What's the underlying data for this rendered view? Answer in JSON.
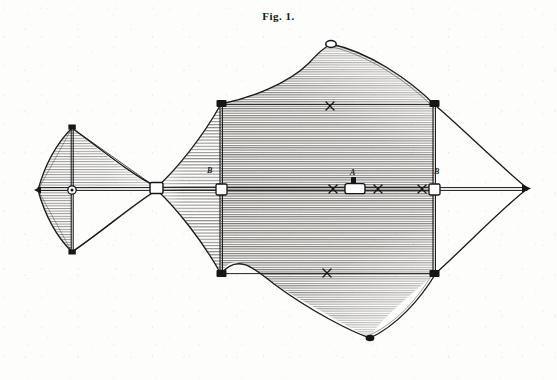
{
  "figure": {
    "caption": "Fig. 1.",
    "domain": "engraving-diagram",
    "background_color": "#fdfdfc",
    "ink_color": "#1b1b1b",
    "shade_color": "#6e6a62"
  },
  "labels": [
    {
      "id": "label-b-left",
      "text": "B",
      "x": 209,
      "y": 171
    },
    {
      "id": "label-a-center",
      "text": "A",
      "x": 352,
      "y": 173
    },
    {
      "id": "label-b-right",
      "text": "B",
      "x": 436,
      "y": 172
    }
  ],
  "markers": {
    "cross_marks": [
      {
        "id": "x-mark-left",
        "x": 333,
        "y": 189
      },
      {
        "id": "x-mark-right",
        "x": 378,
        "y": 189
      },
      {
        "id": "x-mark-upper",
        "x": 330,
        "y": 106
      },
      {
        "id": "x-mark-lower",
        "x": 327,
        "y": 272
      },
      {
        "id": "x-mark-tip",
        "x": 422,
        "y": 189
      }
    ]
  },
  "structure": {
    "spine": {
      "from_x": 38,
      "to_x": 527,
      "y": 189
    },
    "nodes": [
      {
        "id": "node-nose-tip",
        "x": 38,
        "y": 190
      },
      {
        "id": "node-small-cross",
        "x": 72,
        "y": 190
      },
      {
        "id": "node-small-top",
        "x": 72,
        "y": 128
      },
      {
        "id": "node-small-bottom",
        "x": 72,
        "y": 252
      },
      {
        "id": "node-coupling",
        "x": 157,
        "y": 188
      },
      {
        "id": "node-fore-spar-top",
        "x": 221,
        "y": 104
      },
      {
        "id": "node-fore-spar-cross",
        "x": 221,
        "y": 189
      },
      {
        "id": "node-fore-spar-bottom",
        "x": 221,
        "y": 274
      },
      {
        "id": "node-crest-top",
        "x": 331,
        "y": 44
      },
      {
        "id": "node-crest-bottom",
        "x": 370,
        "y": 338
      },
      {
        "id": "node-aft-spar-top",
        "x": 434,
        "y": 104
      },
      {
        "id": "node-aft-spar-cross",
        "x": 434,
        "y": 189
      },
      {
        "id": "node-aft-spar-bottom",
        "x": 434,
        "y": 274
      },
      {
        "id": "node-tail-tip",
        "x": 527,
        "y": 188
      }
    ]
  },
  "panels": [
    {
      "id": "panel-small-kite-upper",
      "hatched": true
    },
    {
      "id": "panel-small-kite-lower",
      "hatched": true
    },
    {
      "id": "panel-fore-upper",
      "hatched": true
    },
    {
      "id": "panel-fore-lower",
      "hatched": true
    },
    {
      "id": "panel-main-upper",
      "hatched": true
    },
    {
      "id": "panel-main-lower",
      "hatched": true
    }
  ]
}
